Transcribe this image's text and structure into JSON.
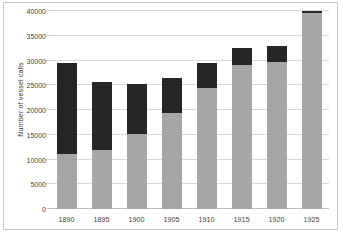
{
  "chart_data": {
    "type": "bar",
    "subtype": "stacked",
    "title": "",
    "xlabel": "",
    "ylabel": "Number of vessel calls",
    "categories": [
      "1890",
      "1895",
      "1900",
      "1905",
      "1910",
      "1915",
      "1920",
      "1925"
    ],
    "ylim": [
      0,
      40000
    ],
    "ytick_labels": [
      "0",
      "5000",
      "10000",
      "15000",
      "20000",
      "25000",
      "30000",
      "35000",
      "40000"
    ],
    "ytick_values": [
      0,
      5000,
      10000,
      15000,
      20000,
      25000,
      30000,
      35000,
      40000
    ],
    "grid": true,
    "legend": "none",
    "series": [
      {
        "name": "lower-segment",
        "color": "#a6a6a6",
        "values": [
          11200,
          12000,
          15100,
          19400,
          24500,
          29000,
          29700,
          39700
        ]
      },
      {
        "name": "upper-segment",
        "color": "#262626",
        "values": [
          18300,
          13600,
          10100,
          7000,
          5000,
          3600,
          3300,
          300
        ]
      }
    ],
    "totals": [
      29500,
      25600,
      25200,
      26400,
      29500,
      32600,
      33000,
      40000
    ]
  },
  "style": {
    "plot_background": "#ffffff",
    "gridline_color": "#d9d9d9",
    "frame_border": "#c8c8c8",
    "text_color": "#3f3f3f"
  }
}
